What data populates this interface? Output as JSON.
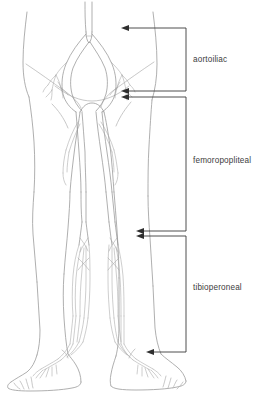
{
  "figure": {
    "title": "Lower extremity arterial anatomy with vascular segment labels",
    "background_color": "#ffffff",
    "line_color": "#9a9a9a",
    "label_color": "#3d3d3d",
    "bracket_color": "#3a3a3a"
  },
  "labels": [
    {
      "id": "aortoiliac",
      "text": "aortoiliac",
      "x": 193,
      "y": 62
    },
    {
      "id": "femoropopliteal",
      "text": "femoropopliteal",
      "x": 193,
      "y": 163
    },
    {
      "id": "tibioperoneal",
      "text": "tibioperoneal",
      "x": 193,
      "y": 290
    }
  ],
  "brackets": [
    {
      "id": "aortoiliac-bracket",
      "spine_x": 186,
      "top_y": 28,
      "bottom_y": 91,
      "arrow_tip_x": 121
    },
    {
      "id": "femoropopliteal-bracket",
      "spine_x": 186,
      "top_y": 97,
      "bottom_y": 231,
      "arrow_tip_x": 121
    },
    {
      "id": "tibioperoneal-bracket",
      "spine_x": 186,
      "top_y": 236,
      "bottom_y": 352,
      "arrow_tip_x": 146
    }
  ],
  "anatomy": {
    "view": "anterior",
    "regions": [
      "pelvis",
      "thighs",
      "knees",
      "calves",
      "ankles",
      "feet"
    ],
    "vessels": [
      "abdominal aorta",
      "common iliac arteries",
      "internal iliac arteries",
      "external iliac arteries",
      "common femoral arteries",
      "profunda femoris arteries",
      "superficial femoral arteries",
      "popliteal arteries",
      "anterior tibial arteries",
      "posterior tibial arteries",
      "peroneal arteries",
      "dorsalis pedis arteries",
      "digital arteries"
    ]
  }
}
